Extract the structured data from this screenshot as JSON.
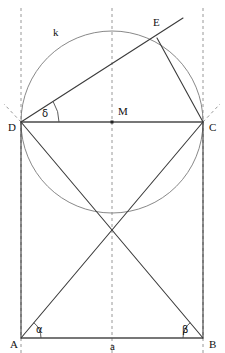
{
  "figure": {
    "width": 225,
    "height": 353,
    "background": "#ffffff",
    "line_color": "#3b3b3b",
    "circle_color": "#7a7a7a",
    "dash_color": "#8d8d8d",
    "label_color": "#111111"
  },
  "points": {
    "A": {
      "label": "A",
      "x": 21,
      "y": 338,
      "label_x": 10,
      "label_y": 348
    },
    "B": {
      "label": "B",
      "x": 203,
      "y": 338,
      "label_x": 209,
      "label_y": 348
    },
    "C": {
      "label": "C",
      "x": 203,
      "y": 122,
      "label_x": 209,
      "label_y": 131
    },
    "D": {
      "label": "D",
      "x": 21,
      "y": 122,
      "label_x": 8,
      "label_y": 131
    },
    "E": {
      "label": "E",
      "x": 157,
      "y": 38,
      "label_x": 153,
      "label_y": 26
    },
    "M": {
      "label": "M",
      "x": 112,
      "y": 122,
      "label_x": 118,
      "label_y": 115
    }
  },
  "circle": {
    "label": "k",
    "center_x": 112,
    "center_y": 122,
    "radius": 91,
    "label_x": 53,
    "label_y": 36
  },
  "segments": {
    "base_a": {
      "label": "a",
      "label_x": 110,
      "label_y": 350
    },
    "rectangle_sides": [
      "AB",
      "BC",
      "CD",
      "DA"
    ],
    "diagonals": [
      "DB",
      "CA"
    ],
    "chord_DE": "DE",
    "chord_EC": "EC",
    "ray_DE_extended_x": 183,
    "ray_DE_extended_y": 18,
    "diagonal_crossing_x": 112,
    "diagonal_crossing_y": 230
  },
  "angles": {
    "alpha": {
      "label": "α",
      "at": "A",
      "label_x": 36,
      "label_y": 333,
      "radius": 20
    },
    "beta": {
      "label": "β",
      "at": "B",
      "label_x": 182,
      "label_y": 333,
      "radius": 20
    },
    "delta": {
      "label": "δ",
      "at": "D",
      "label_x": 42,
      "label_y": 117,
      "radius": 38
    }
  },
  "guides": {
    "vertical_left_x": 21,
    "vertical_center_x": 112,
    "vertical_right_x": 203,
    "vertical_top_y": 8,
    "vertical_bottom_y": 353,
    "tangent_ray_D": {
      "x1": 21,
      "y1": 122,
      "x2": 4,
      "y2": 104
    },
    "tangent_ray_C": {
      "x1": 203,
      "y1": 122,
      "x2": 220,
      "y2": 104
    }
  }
}
